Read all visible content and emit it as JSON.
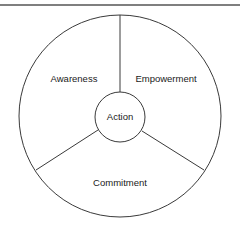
{
  "diagram": {
    "center": {
      "label": "Action"
    },
    "segments": [
      {
        "label": "Awareness"
      },
      {
        "label": "Empowerment"
      },
      {
        "label": "Commitment"
      }
    ],
    "colors": {
      "stroke": "#3a3a3a",
      "text": "#1a1a1a",
      "background": "#ffffff"
    }
  }
}
